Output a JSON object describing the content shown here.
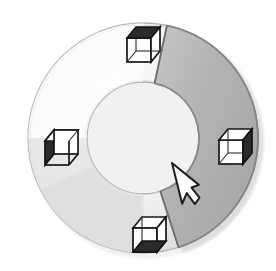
{
  "canvas": {
    "width": 276,
    "height": 271,
    "background": "#ffffff",
    "title": "Circular ring selection diagram with four wireframe cubes"
  },
  "ring": {
    "label": "annulus-ring",
    "center_x": 143,
    "center_y": 138,
    "outer_radius": 115,
    "inner_radius": 56,
    "base_fill": "#f4f4f4",
    "outline": "#b0b0b0",
    "shadow_fill": "#e2e2e2"
  },
  "selected_arc": {
    "label": "selected-arc-segment",
    "start_angle_deg": -78,
    "end_angle_deg": 72,
    "sweep_deg": 150,
    "fill": "#b9b9b9",
    "outline": "#6f6f6f",
    "state": "selected"
  },
  "cubes": [
    {
      "id": "cube-top",
      "position": "top",
      "center_x": 143,
      "center_y": 44,
      "size": 26,
      "shaded_face": "top",
      "shade_color": "#2b2b2b",
      "line_color": "#1a1a1a",
      "face_fill": "#ffffff"
    },
    {
      "id": "cube-right",
      "position": "right",
      "center_x": 236,
      "center_y": 145,
      "size": 26,
      "shaded_face": "right",
      "shade_color": "#2b2b2b",
      "line_color": "#1a1a1a",
      "face_fill": "#ffffff"
    },
    {
      "id": "cube-bottom",
      "position": "bottom",
      "center_x": 150,
      "center_y": 235,
      "size": 26,
      "shaded_face": "bottom",
      "shade_color": "#2b2b2b",
      "line_color": "#1a1a1a",
      "face_fill": "#ffffff"
    },
    {
      "id": "cube-left",
      "position": "left",
      "center_x": 62,
      "center_y": 146,
      "size": 26,
      "shaded_face": "left",
      "shade_color": "#2b2b2b",
      "line_color": "#1a1a1a",
      "face_fill": "#ffffff"
    }
  ],
  "cursor": {
    "label": "mouse-pointer",
    "tip_x": 172,
    "tip_y": 163,
    "fill": "#ffffff",
    "outline": "#1d1d1d",
    "height": 42
  }
}
